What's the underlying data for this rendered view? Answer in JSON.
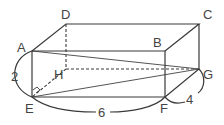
{
  "figure": {
    "type": "rectangular-prism",
    "vertices": {
      "A": {
        "label": "A",
        "x": 32,
        "y": 51
      },
      "B": {
        "label": "B",
        "x": 165,
        "y": 51
      },
      "C": {
        "label": "C",
        "x": 199,
        "y": 24
      },
      "D": {
        "label": "D",
        "x": 66,
        "y": 24
      },
      "E": {
        "label": "E",
        "x": 32,
        "y": 97
      },
      "F": {
        "label": "F",
        "x": 165,
        "y": 97
      },
      "G": {
        "label": "G",
        "x": 199,
        "y": 69
      },
      "H": {
        "label": "H",
        "x": 66,
        "y": 69
      }
    },
    "dimensions": {
      "AE": "2",
      "EF": "6",
      "FG": "4"
    },
    "segments_solid": [
      "AB",
      "BF",
      "FE",
      "EA",
      "AD",
      "DC",
      "CB",
      "CG",
      "GF",
      "AG",
      "EG"
    ],
    "segments_dashed": [
      "DH",
      "HE",
      "HG"
    ],
    "right_angle_at": "E",
    "colors": {
      "line": "#3a3a3a",
      "label": "#444444",
      "background": "#ffffff"
    }
  }
}
